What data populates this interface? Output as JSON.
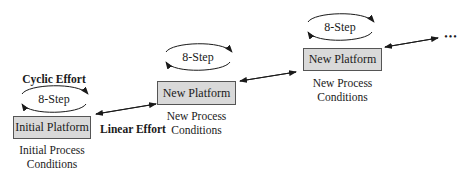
{
  "diagram": {
    "cyclic_label": "Cyclic Effort",
    "linear_label": "Linear Effort",
    "continuation": "•••",
    "stages": [
      {
        "platform": "Initial Platform",
        "cycle": "8-Step",
        "conditions_line1": "Initial Process",
        "conditions_line2": "Conditions"
      },
      {
        "platform": "New Platform",
        "cycle": "8-Step",
        "conditions_line1": "New Process",
        "conditions_line2": "Conditions"
      },
      {
        "platform": "New Platform",
        "cycle": "8-Step",
        "conditions_line1": "New Process",
        "conditions_line2": "Conditions"
      }
    ],
    "colors": {
      "box_fill": "#d9d9d9",
      "box_border": "#555555",
      "line": "#1a1a1a"
    }
  }
}
